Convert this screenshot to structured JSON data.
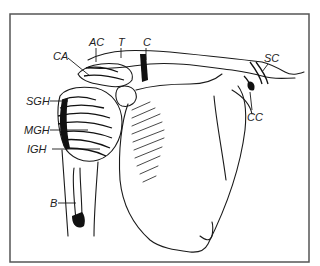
{
  "figure": {
    "stroke_color": "#1a1a1a",
    "background": "#ffffff",
    "labels": [
      {
        "id": "AC",
        "text": "AC",
        "x": 89,
        "y": 37
      },
      {
        "id": "T",
        "text": "T",
        "x": 118,
        "y": 37
      },
      {
        "id": "C",
        "text": "C",
        "x": 143,
        "y": 37
      },
      {
        "id": "CA",
        "text": "CA",
        "x": 53,
        "y": 51
      },
      {
        "id": "SC",
        "text": "SC",
        "x": 264,
        "y": 53
      },
      {
        "id": "SGH",
        "text": "SGH",
        "x": 26,
        "y": 96
      },
      {
        "id": "MGH",
        "text": "MGH",
        "x": 24,
        "y": 125
      },
      {
        "id": "IGH",
        "text": "IGH",
        "x": 27,
        "y": 145
      },
      {
        "id": "CC",
        "text": "CC",
        "x": 247,
        "y": 112
      },
      {
        "id": "B",
        "text": "B",
        "x": 50,
        "y": 198
      }
    ]
  }
}
